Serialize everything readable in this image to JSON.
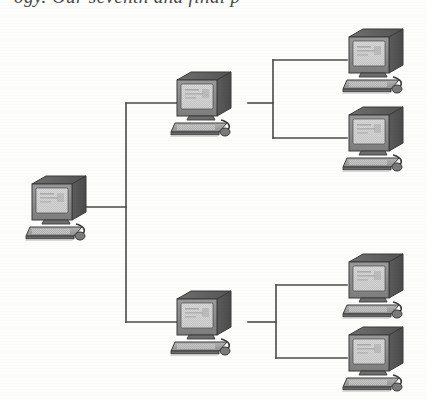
{
  "page": {
    "type": "network-topology-diagram",
    "background_color": "#ffffff",
    "width": 427,
    "height": 399
  },
  "caption": {
    "partial_text": "ogy. Our seventh and final p",
    "note": "bottom edge of a line of italic serif body text, cropped at image top"
  },
  "colors": {
    "line": "#4a4a4a",
    "icon_outline": "#3a3a3a",
    "icon_dark": "#5e5e5e",
    "icon_mid": "#8a8a8a",
    "icon_light": "#c9c9c9",
    "screen": "#d8d8d8",
    "paper": "#ffffff"
  },
  "topology": {
    "kind": "tree",
    "levels": 3,
    "node_count": 7,
    "root_id": "root",
    "branch_ids": [
      "branch-upper",
      "branch-lower"
    ],
    "leaf_ids": [
      "leaf-1",
      "leaf-2",
      "leaf-3",
      "leaf-4"
    ]
  },
  "nodes": [
    {
      "id": "root",
      "label": "root computer",
      "level": 1,
      "x": 55,
      "y": 207,
      "port": "right"
    },
    {
      "id": "branch-upper",
      "label": "upper branch computer",
      "level": 2,
      "x": 200,
      "y": 103,
      "port": "both"
    },
    {
      "id": "branch-lower",
      "label": "lower branch computer",
      "level": 2,
      "x": 200,
      "y": 322,
      "port": "both"
    },
    {
      "id": "leaf-1",
      "label": "upper branch leaf computer 1",
      "level": 3,
      "x": 372,
      "y": 60,
      "port": "left"
    },
    {
      "id": "leaf-2",
      "label": "upper branch leaf computer 2",
      "level": 3,
      "x": 372,
      "y": 138,
      "port": "left"
    },
    {
      "id": "leaf-3",
      "label": "lower branch leaf computer 1",
      "level": 3,
      "x": 372,
      "y": 285,
      "port": "left"
    },
    {
      "id": "leaf-4",
      "label": "lower branch leaf computer 2",
      "level": 3,
      "x": 372,
      "y": 358,
      "port": "left"
    }
  ],
  "links": [
    {
      "id": "link-root-trunk",
      "from": "root",
      "to": "trunk",
      "label": "root to trunk"
    },
    {
      "id": "link-trunk-upper",
      "from": "trunk",
      "to": "branch-upper",
      "label": "trunk to upper branch"
    },
    {
      "id": "link-trunk-lower",
      "from": "trunk",
      "to": "branch-lower",
      "label": "trunk to lower branch"
    },
    {
      "id": "link-upper-leaf-1",
      "from": "branch-upper",
      "to": "leaf-1",
      "label": "upper branch to leaf 1"
    },
    {
      "id": "link-upper-leaf-2",
      "from": "branch-upper",
      "to": "leaf-2",
      "label": "upper branch to leaf 2"
    },
    {
      "id": "link-lower-leaf-3",
      "from": "branch-lower",
      "to": "leaf-3",
      "label": "lower branch to leaf 3"
    },
    {
      "id": "link-lower-leaf-4",
      "from": "branch-lower",
      "to": "leaf-4",
      "label": "lower branch to leaf 4"
    }
  ],
  "geometry": {
    "main_trunk_x": 126,
    "main_trunk_top_y": 103,
    "main_trunk_bottom_y": 322,
    "root_stub_from_x": 85,
    "root_stub_y": 207,
    "upper_fan_x": 273,
    "upper_fan_top_y": 60,
    "upper_fan_bottom_y": 138,
    "upper_fan_stub_y": 103,
    "lower_fan_x": 276,
    "lower_fan_top_y": 285,
    "lower_fan_bottom_y": 358,
    "lower_fan_stub_y": 322,
    "leaf_entry_x": 345,
    "line_width": 1.6
  }
}
